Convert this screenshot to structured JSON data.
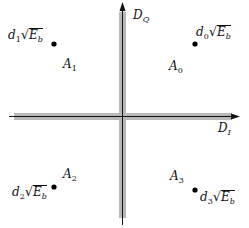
{
  "diagram": {
    "type": "signal-space-constellation",
    "axes": {
      "vertical": {
        "label_main": "D",
        "label_sub": "Q"
      },
      "horizontal": {
        "label_main": "D",
        "label_sub": "I"
      }
    },
    "regions": [
      {
        "id": "A0",
        "label_main": "A",
        "label_sub": "0",
        "quadrant": "upper-right"
      },
      {
        "id": "A1",
        "label_main": "A",
        "label_sub": "1",
        "quadrant": "upper-left"
      },
      {
        "id": "A2",
        "label_main": "A",
        "label_sub": "2",
        "quadrant": "lower-left"
      },
      {
        "id": "A3",
        "label_main": "A",
        "label_sub": "3",
        "quadrant": "lower-right"
      }
    ],
    "points": [
      {
        "id": "d0",
        "coef": "d",
        "coef_sub": "0",
        "radical": "E",
        "radical_sub": "b",
        "quadrant": "upper-right"
      },
      {
        "id": "d1",
        "coef": "d",
        "coef_sub": "1",
        "radical": "E",
        "radical_sub": "b",
        "quadrant": "upper-left"
      },
      {
        "id": "d2",
        "coef": "d",
        "coef_sub": "2",
        "radical": "E",
        "radical_sub": "b",
        "quadrant": "lower-left"
      },
      {
        "id": "d3",
        "coef": "d",
        "coef_sub": "3",
        "radical": "E",
        "radical_sub": "b",
        "quadrant": "lower-right"
      }
    ],
    "colors": {
      "decision_boundary": "#b8b8b8",
      "axis_line": "#111111",
      "point": "#000000"
    }
  }
}
